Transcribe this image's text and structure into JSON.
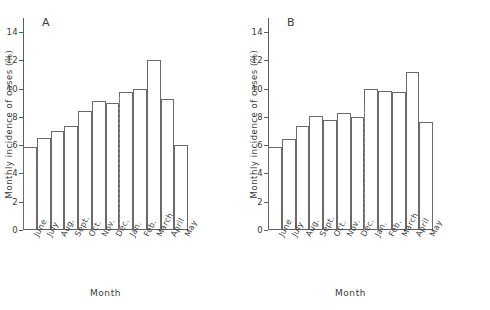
{
  "figure": {
    "xlabel": "Month",
    "ylabel": "Monthly incidence of cases (%)"
  },
  "panels": [
    {
      "letter": "A"
    },
    {
      "letter": "B"
    }
  ],
  "axis": {
    "yticks": [
      "0",
      "2",
      "4",
      "6",
      "8",
      "10",
      "12",
      "14"
    ]
  },
  "chart_data": [
    {
      "type": "bar",
      "title": "A",
      "xlabel": "Month",
      "ylabel": "Monthly incidence of cases (%)",
      "ylim": [
        0,
        15
      ],
      "yticks": [
        0,
        2,
        4,
        6,
        8,
        10,
        12,
        14
      ],
      "grid": false,
      "legend": "none",
      "bar_style": "outlined-step-histogram",
      "year_divider_after": "Dec.",
      "categories": [
        "June",
        "July",
        "Aug.",
        "Sept.",
        "Oct.",
        "Nov.",
        "Dec.",
        "Jan.",
        "Feb.",
        "March",
        "April",
        "May"
      ],
      "values": [
        5.9,
        6.5,
        7.0,
        7.35,
        8.4,
        9.1,
        9.0,
        9.75,
        10.0,
        12.0,
        9.3,
        6.05
      ]
    },
    {
      "type": "bar",
      "title": "B",
      "xlabel": "Month",
      "ylabel": "Monthly incidence of cases (%)",
      "ylim": [
        0,
        15
      ],
      "yticks": [
        0,
        2,
        4,
        6,
        8,
        10,
        12,
        14
      ],
      "grid": false,
      "legend": "none",
      "bar_style": "outlined-step-histogram",
      "year_divider_after": "Dec.",
      "categories": [
        "June",
        "July",
        "Aug.",
        "Sept.",
        "Oct.",
        "Nov.",
        "Dec.",
        "Jan.",
        "Feb.",
        "March",
        "April",
        "May"
      ],
      "values": [
        5.9,
        6.45,
        7.35,
        8.05,
        7.8,
        8.3,
        8.0,
        9.95,
        9.85,
        9.8,
        11.15,
        7.65
      ]
    }
  ]
}
